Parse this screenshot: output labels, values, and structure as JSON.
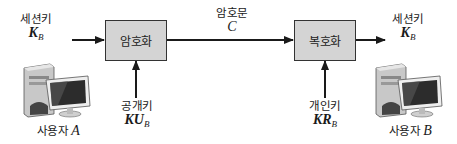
{
  "diagram": {
    "title": "",
    "sender": {
      "input_label": "세션키",
      "input_symbol": "K",
      "input_subscript": "B",
      "user_label": "사용자",
      "user_name": "A",
      "icon": "desktop-computer-icon"
    },
    "encrypt_box": {
      "label": "암호화",
      "key_label": "공개키",
      "key_symbol": "KU",
      "key_subscript": "B"
    },
    "channel": {
      "label": "암호문",
      "symbol": "C"
    },
    "decrypt_box": {
      "label": "복호화",
      "key_label": "개인키",
      "key_symbol": "KR",
      "key_subscript": "B"
    },
    "receiver": {
      "output_label": "세션키",
      "output_symbol": "K",
      "output_subscript": "B",
      "user_label": "사용자",
      "user_name": "B",
      "icon": "desktop-computer-icon"
    },
    "colors": {
      "box_fill": "#d4d4d4",
      "stroke": "#1a1a1a"
    }
  }
}
